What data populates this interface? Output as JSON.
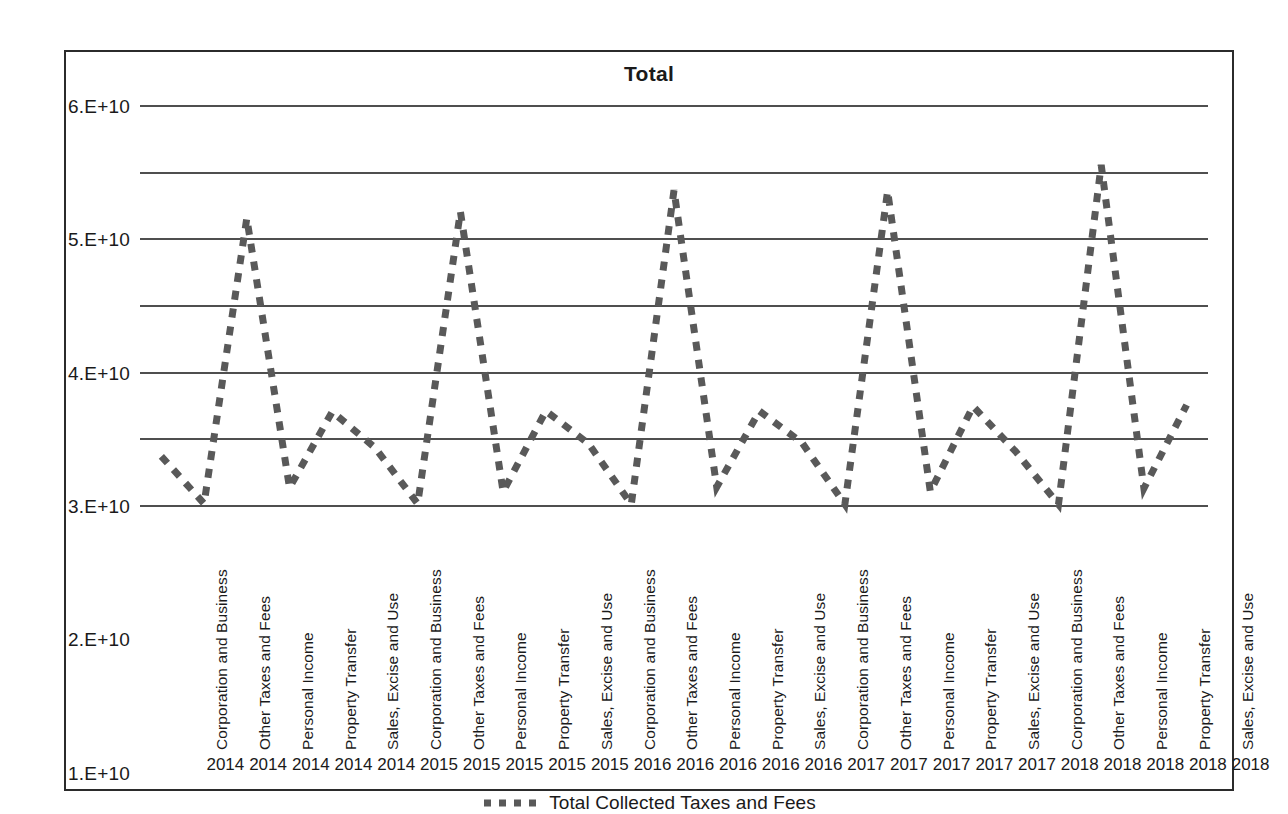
{
  "chart_data": {
    "type": "line",
    "title": "Total",
    "xlabel": "",
    "ylabel": "",
    "ylim": [
      0,
      60000000000
    ],
    "grid": true,
    "legend_position": "bottom",
    "legend": [
      "Total Collected Taxes and Fees"
    ],
    "ytick_labels": [
      "0.E+00",
      "1.E+10",
      "2.E+10",
      "3.E+10",
      "4.E+10",
      "5.E+10",
      "6.E+10"
    ],
    "ytick_values": [
      0,
      10000000000,
      20000000000,
      30000000000,
      40000000000,
      50000000000,
      60000000000
    ],
    "categories": [
      "Corporation and Business",
      "Other Taxes and Fees",
      "Personal Income",
      "Property Transfer",
      "Sales, Excise and Use",
      "Corporation and Business",
      "Other Taxes and Fees",
      "Personal Income",
      "Property Transfer",
      "Sales, Excise and Use",
      "Corporation and Business",
      "Other Taxes and Fees",
      "Personal Income",
      "Property Transfer",
      "Sales, Excise and Use",
      "Corporation and Business",
      "Other Taxes and Fees",
      "Personal Income",
      "Property Transfer",
      "Sales, Excise and Use",
      "Corporation and Business",
      "Other Taxes and Fees",
      "Personal Income",
      "Property Transfer",
      "Sales, Excise and Use"
    ],
    "years": [
      "2014",
      "2014",
      "2014",
      "2014",
      "2014",
      "2015",
      "2015",
      "2015",
      "2015",
      "2015",
      "2016",
      "2016",
      "2016",
      "2016",
      "2016",
      "2017",
      "2017",
      "2017",
      "2017",
      "2017",
      "2018",
      "2018",
      "2018",
      "2018",
      "2018"
    ],
    "series": [
      {
        "name": "Total Collected Taxes and Fees",
        "color": "#595959",
        "style": "dashed",
        "values": [
          7300000000,
          200000000,
          43000000000,
          2600000000,
          14000000000,
          8600000000,
          200000000,
          44000000000,
          2000000000,
          14100000000,
          9200000000,
          100000000,
          47200000000,
          2700000000,
          14100000000,
          9300000000,
          100000000,
          47100000000,
          2000000000,
          14800000000,
          8000000000,
          100000000,
          51000000000,
          2500000000,
          15000000000
        ]
      }
    ]
  },
  "legend": {
    "label": "Total Collected Taxes and Fees"
  },
  "colors": {
    "series": "#595959",
    "gridline": "#4f4f4f",
    "frame": "#2b2b2b",
    "text": "#1a1a1a",
    "background": "#ffffff"
  }
}
